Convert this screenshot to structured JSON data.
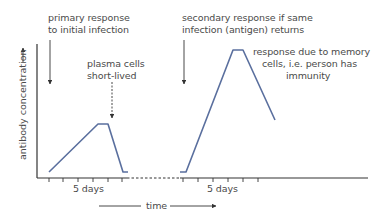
{
  "diagram": {
    "y_axis_label": "antibody concentration",
    "x_axis_label": "time",
    "tick_label_primary": "5 days",
    "tick_label_secondary": "5 days",
    "annotations": {
      "primary_line1": "primary response",
      "primary_line2": "to initial infection",
      "plasma_line1": "plasma cells",
      "plasma_line2": "short-lived",
      "secondary_line1": "secondary response if same",
      "secondary_line2": "infection (antigen) returns",
      "memory_line1": "response due to memory",
      "memory_line2": "cells, i.e. person has",
      "memory_line3": "immunity"
    },
    "colors": {
      "curve": "#5a6f9e",
      "axis": "#333333",
      "text": "#4a4a4a"
    }
  }
}
